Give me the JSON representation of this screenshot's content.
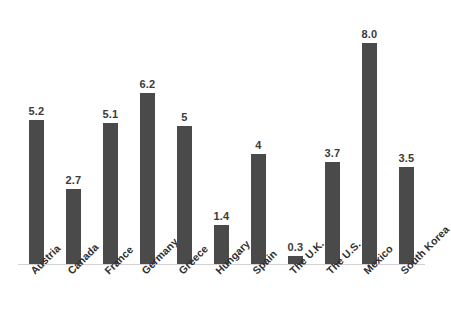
{
  "chart_data": {
    "type": "bar",
    "title": "",
    "subtitle": "",
    "xlabel": "",
    "ylabel": "",
    "grid": false,
    "legend": false,
    "ylim": [
      0,
      8.4
    ],
    "categories": [
      "Austria",
      "Canada",
      "France",
      "Germany",
      "Greece",
      "Hungary",
      "Spain",
      "The U.K.",
      "The U.S.",
      "Mexico",
      "South Korea"
    ],
    "values": [
      5.2,
      2.7,
      5.1,
      6.2,
      5,
      1.4,
      4,
      0.3,
      3.7,
      8.0,
      3.5
    ],
    "value_labels": [
      "5.2",
      "2.7",
      "5.1",
      "6.2",
      "5",
      "1.4",
      "4",
      "0.3",
      "3.7",
      "8.0",
      "3.5"
    ],
    "bar_color": "#4a4a4a",
    "baseline_color": "#d2d2d2",
    "background_color": "#ffffff",
    "label_color": "#2e2e2e"
  }
}
